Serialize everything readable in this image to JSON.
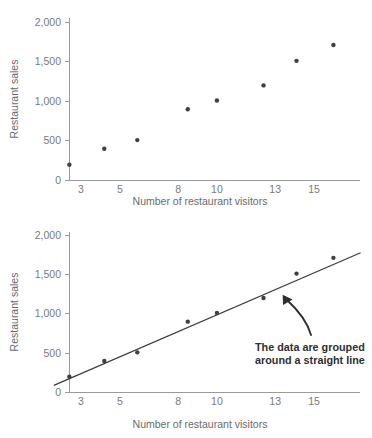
{
  "figure": {
    "panels": [
      {
        "id": "top",
        "name": "scatter-plot-without-trend-line"
      },
      {
        "id": "bottom",
        "name": "scatter-plot-with-trend-line"
      }
    ]
  },
  "chart_data": [
    {
      "type": "scatter",
      "title": "",
      "xlabel": "Number of restaurant visitors",
      "ylabel": "Restaurant sales",
      "xlim": [
        1.2,
        18.2
      ],
      "ylim": [
        0,
        2100
      ],
      "xticks": [
        3,
        5,
        8,
        10,
        13,
        15
      ],
      "xtick_labels": [
        "3",
        "5",
        "8",
        "10",
        "13",
        "15"
      ],
      "yticks": [
        0,
        500,
        1000,
        1500,
        2000
      ],
      "ytick_labels": [
        "0",
        "500",
        "1,000",
        "1,500",
        "2,000"
      ],
      "grid": false,
      "legend": "none",
      "x": [
        2.4,
        4.2,
        5.9,
        8.5,
        10.0,
        12.4,
        14.1,
        16.0
      ],
      "y": [
        200,
        400,
        510,
        900,
        1010,
        1200,
        1510,
        1710
      ],
      "trend_line": false,
      "annotations": []
    },
    {
      "type": "scatter",
      "title": "",
      "xlabel": "Number of restaurant visitors",
      "ylabel": "Restaurant sales",
      "xlim": [
        1.2,
        18.2
      ],
      "ylim": [
        0,
        2100
      ],
      "xticks": [
        3,
        5,
        8,
        10,
        13,
        15
      ],
      "xtick_labels": [
        "3",
        "5",
        "8",
        "10",
        "13",
        "15"
      ],
      "yticks": [
        0,
        500,
        1000,
        1500,
        2000
      ],
      "ytick_labels": [
        "0",
        "500",
        "1,000",
        "1,500",
        "2,000"
      ],
      "grid": false,
      "legend": "none",
      "x": [
        2.4,
        4.2,
        5.9,
        8.5,
        10.0,
        12.4,
        14.1,
        16.0
      ],
      "y": [
        200,
        400,
        510,
        900,
        1010,
        1200,
        1510,
        1710
      ],
      "trend_line": true,
      "trend_line_endpoints": {
        "x0": 1.6,
        "y0": 90,
        "x1": 17.4,
        "y1": 1775
      },
      "annotations": [
        {
          "name": "trend-annotation",
          "line1": "The data are grouped",
          "line2": "around a straight line",
          "arrow": "curved-arrow-up-left"
        }
      ]
    }
  ],
  "colors": {
    "dot": "#3f3f44",
    "axis": "#9a9a9d",
    "tick_text": "#79797c",
    "axis_title": "#6a6a6d",
    "annotation_text": "#2f2f33",
    "trend_line": "#3b3b40",
    "background": "#ffffff"
  }
}
